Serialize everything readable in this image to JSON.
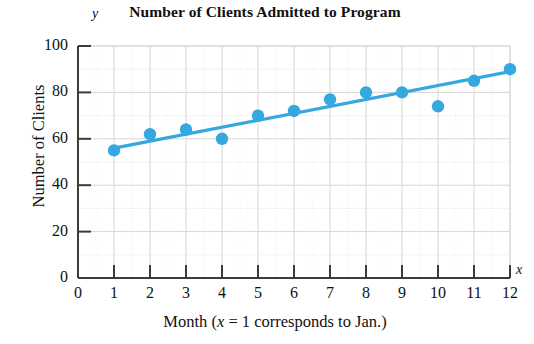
{
  "chart_data": {
    "type": "scatter",
    "title": "Number of Clients Admitted to Program",
    "xlabel_text": "Month (",
    "xlabel_math": "x",
    "xlabel_tail": " = 1 corresponds to Jan.)",
    "xlabel_full": "Month (x = 1 corresponds to Jan.)",
    "ylabel": "Number of Clients",
    "x_axis_variable": "x",
    "y_axis_variable": "y",
    "xlim": [
      0,
      12
    ],
    "ylim": [
      0,
      100
    ],
    "xticks": [
      "0",
      "1",
      "2",
      "3",
      "4",
      "5",
      "6",
      "7",
      "8",
      "9",
      "10",
      "11",
      "12"
    ],
    "yticks": [
      "0",
      "20",
      "40",
      "60",
      "80",
      "100"
    ],
    "grid": true,
    "legend": "none",
    "point_color": "#35a8e0",
    "line_color": "#35a8e0",
    "axis_color": "#3b3b3b",
    "grid_color": "#d8d8d8",
    "x": [
      1,
      2,
      3,
      4,
      5,
      6,
      7,
      8,
      9,
      10,
      11,
      12
    ],
    "values": [
      55,
      62,
      64,
      60,
      70,
      72,
      77,
      80,
      80,
      74,
      85,
      90
    ],
    "series": [
      {
        "name": "Number of clients admitted",
        "type": "scatter",
        "x": [
          1,
          2,
          3,
          4,
          5,
          6,
          7,
          8,
          9,
          10,
          11,
          12
        ],
        "values": [
          55,
          62,
          64,
          60,
          70,
          72,
          77,
          80,
          80,
          74,
          85,
          90
        ]
      },
      {
        "name": "Regression line",
        "type": "line",
        "x": [
          1,
          12
        ],
        "values": [
          56,
          89
        ]
      }
    ]
  }
}
